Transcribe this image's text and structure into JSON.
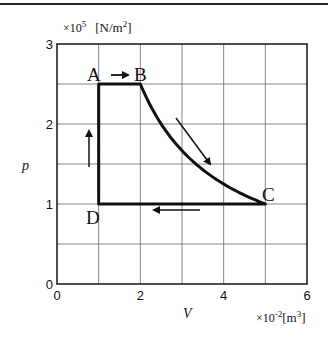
{
  "chart_data": {
    "type": "line",
    "title": "",
    "xlabel": "V",
    "xunit": "×10⁻²[m³]",
    "xunit_base": "×10",
    "xunit_exp": "-2",
    "xunit_bracket": "[m",
    "xunit_bracket_exp": "3",
    "xunit_close": "]",
    "ylabel": "p",
    "yunit_base": "×10",
    "yunit_exp": "5",
    "yunit_bracket": "[N/m",
    "yunit_bracket_exp": "2",
    "yunit_close": "]",
    "xlim": [
      0,
      6
    ],
    "ylim": [
      0,
      3
    ],
    "x_ticks": [
      0,
      2,
      4,
      6
    ],
    "y_ticks": [
      0,
      1,
      2,
      3
    ],
    "x_tick_labels": [
      "0",
      "2",
      "4",
      "6"
    ],
    "y_tick_labels": [
      "0",
      "1",
      "2",
      "3"
    ],
    "grid": true,
    "grid_x_step": 1,
    "grid_y_step": 0.5,
    "points": [
      {
        "label": "A",
        "V": 1,
        "p": 2.5
      },
      {
        "label": "B",
        "V": 2,
        "p": 2.5
      },
      {
        "label": "C",
        "V": 5,
        "p": 1
      },
      {
        "label": "D",
        "V": 1,
        "p": 1
      }
    ],
    "series": [
      {
        "name": "A→B (isobaric)",
        "x": [
          1,
          2
        ],
        "y": [
          2.5,
          2.5
        ]
      },
      {
        "name": "B→C (isothermal, pV=const)",
        "x": [
          2,
          2.5,
          3,
          3.5,
          4,
          4.5,
          5
        ],
        "y": [
          2.5,
          2.0,
          1.667,
          1.429,
          1.25,
          1.111,
          1.0
        ]
      },
      {
        "name": "C→D (isobaric)",
        "x": [
          5,
          1
        ],
        "y": [
          1,
          1
        ]
      },
      {
        "name": "D→A (isochoric)",
        "x": [
          1,
          1
        ],
        "y": [
          1,
          2.5
        ]
      }
    ],
    "annotations": [
      {
        "type": "arrow",
        "direction": "right",
        "near": "A→B"
      },
      {
        "type": "arrow",
        "direction": "down-right",
        "near": "B→C"
      },
      {
        "type": "arrow",
        "direction": "left",
        "near": "C→D"
      },
      {
        "type": "arrow",
        "direction": "up",
        "near": "D→A"
      }
    ]
  }
}
